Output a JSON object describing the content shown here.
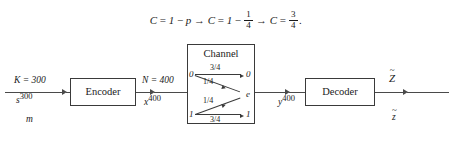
{
  "diagram": {
    "formula": {
      "parts": [
        {
          "type": "text",
          "value": "C"
        },
        {
          "type": "op",
          "value": "="
        },
        {
          "type": "text",
          "value": "1"
        },
        {
          "type": "op",
          "value": "−"
        },
        {
          "type": "text",
          "value": "p"
        },
        {
          "type": "op",
          "value": "→"
        },
        {
          "type": "text",
          "value": "C"
        },
        {
          "type": "op",
          "value": "="
        },
        {
          "type": "text",
          "value": "1"
        },
        {
          "type": "op",
          "value": "−"
        },
        {
          "type": "frac",
          "num": "1",
          "den": "4"
        },
        {
          "type": "op",
          "value": "→"
        },
        {
          "type": "text",
          "value": "C"
        },
        {
          "type": "op",
          "value": "="
        },
        {
          "type": "frac",
          "num": "3",
          "den": "4"
        },
        {
          "type": "text",
          "value": "."
        }
      ],
      "plain": "C = 1 − p → C = 1 − 1/4 → C = 3/4."
    },
    "blocks": {
      "encoder": "Encoder",
      "decoder": "Decoder",
      "channel": "Channel"
    },
    "signals": {
      "input_top": "K = 300",
      "input_symbol": "s",
      "input_length": "300",
      "input_bottom": "m",
      "encoded_top": "N = 400",
      "encoded_symbol": "x",
      "encoded_length": "400",
      "received_symbol": "y",
      "received_length": "400",
      "output_symbol": "Z",
      "output_accent": "~",
      "output_bottom": "z"
    },
    "channel_model": {
      "type": "binary-erasure-channel",
      "erasure_probability": "1/4",
      "input_nodes": [
        "0",
        "1"
      ],
      "output_nodes": [
        "0",
        "e",
        "1"
      ],
      "transitions": [
        {
          "from": "0",
          "to": "0",
          "prob": "3/4"
        },
        {
          "from": "0",
          "to": "e",
          "prob": "1/4"
        },
        {
          "from": "1",
          "to": "e",
          "prob": "1/4"
        },
        {
          "from": "1",
          "to": "1",
          "prob": "3/4"
        }
      ]
    },
    "colors": {
      "ink": "#1a1a1a",
      "line": "#4a4a4a",
      "border": "#3a3a3a",
      "background": "#ffffff"
    }
  }
}
